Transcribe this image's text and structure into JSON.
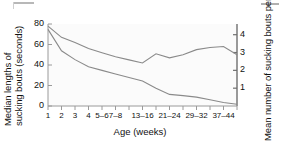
{
  "chart_data": {
    "type": "line",
    "title": "",
    "xlabel": "Age (weeks)",
    "ylabel": "Median lengths of sucking bouts (seconds)",
    "ylabel_line1": "Median lengths of",
    "ylabel_line2": "sucking bouts (seconds)",
    "y2label": "Mean number of sucking bouts per hour",
    "y2label_line1": "Mean number of",
    "y2label_line2": "sucking bouts per hour",
    "categories": [
      "1",
      "2",
      "3",
      "4",
      "5–6",
      "7–8",
      "9–12",
      "13–16",
      "17–20",
      "21–24",
      "25–28",
      "29–32",
      "33–36",
      "37–44",
      "45–52"
    ],
    "visible_tick_labels": [
      "1",
      "2",
      "3",
      "4",
      "5–6",
      "7–8",
      "",
      "13–16",
      "",
      "21–24",
      "",
      "29–32",
      "",
      "37–44",
      ""
    ],
    "yticks": [
      0,
      20,
      40,
      60,
      80
    ],
    "ylim": [
      0,
      80
    ],
    "y2ticks": [
      1,
      2,
      3,
      4
    ],
    "y2lim": [
      0,
      4.6
    ],
    "grid": false,
    "legend": false,
    "series": [
      {
        "name": "Median lengths of sucking bouts (seconds)",
        "axis": "left",
        "color": "#8a8a8a",
        "values": [
          78,
          67,
          62,
          56,
          52,
          48,
          45,
          42,
          51,
          47,
          50,
          55,
          57,
          58,
          50
        ]
      },
      {
        "name": "Mean number of sucking bouts per hour",
        "axis": "right",
        "color": "#8a8a8a",
        "values": [
          4.3,
          3.1,
          2.6,
          2.2,
          2.0,
          1.8,
          1.6,
          1.4,
          1.0,
          0.65,
          0.58,
          0.5,
          0.35,
          0.2,
          0.1
        ]
      }
    ]
  }
}
